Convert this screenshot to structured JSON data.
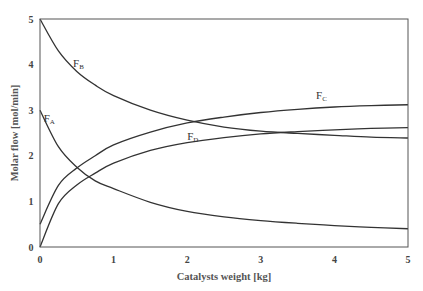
{
  "chart_data": {
    "type": "line",
    "title": "",
    "xlabel": "Catalysts weight [kg]",
    "ylabel": "Molar flow [mol/min]",
    "xlim": [
      0,
      5
    ],
    "ylim": [
      0,
      5
    ],
    "xticks": [
      0,
      1,
      2,
      3,
      4,
      5
    ],
    "yticks": [
      0,
      1,
      2,
      3,
      4,
      5
    ],
    "grid": false,
    "legend": "inline labels",
    "x": [
      0,
      0.25,
      0.5,
      0.75,
      1,
      1.5,
      2,
      2.5,
      3,
      3.5,
      4,
      4.5,
      5
    ],
    "series": [
      {
        "name": "F_A",
        "label_main": "F",
        "label_sub": "A",
        "label_pos": [
          0.05,
          2.75
        ],
        "values": [
          3.0,
          2.2,
          1.75,
          1.45,
          1.28,
          0.98,
          0.78,
          0.66,
          0.58,
          0.52,
          0.47,
          0.43,
          0.4
        ]
      },
      {
        "name": "F_B",
        "label_main": "F",
        "label_sub": "B",
        "label_pos": [
          0.45,
          3.95
        ],
        "values": [
          5.0,
          4.3,
          3.85,
          3.55,
          3.32,
          3.0,
          2.78,
          2.63,
          2.54,
          2.49,
          2.45,
          2.41,
          2.39
        ]
      },
      {
        "name": "F_C",
        "label_main": "F",
        "label_sub": "C",
        "label_pos": [
          3.75,
          3.25
        ],
        "values": [
          0.5,
          1.35,
          1.73,
          2.0,
          2.24,
          2.52,
          2.72,
          2.85,
          2.95,
          3.02,
          3.07,
          3.1,
          3.12
        ]
      },
      {
        "name": "F_D",
        "label_main": "F",
        "label_sub": "D",
        "label_pos": [
          2.0,
          2.35
        ],
        "values": [
          0.0,
          0.95,
          1.36,
          1.62,
          1.84,
          2.12,
          2.29,
          2.4,
          2.48,
          2.53,
          2.57,
          2.6,
          2.62
        ]
      }
    ],
    "line_color": "#333333"
  }
}
